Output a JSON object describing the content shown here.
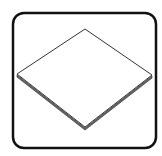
{
  "icon": {
    "semantic": "flat-plate-icon",
    "description": "Isometric thin flat plate inside a rounded square frame",
    "colors": {
      "background": "#ffffff",
      "frame": "#111111",
      "outline": "#333333",
      "edge_shadow": "#555555",
      "fill": "#ffffff"
    }
  }
}
